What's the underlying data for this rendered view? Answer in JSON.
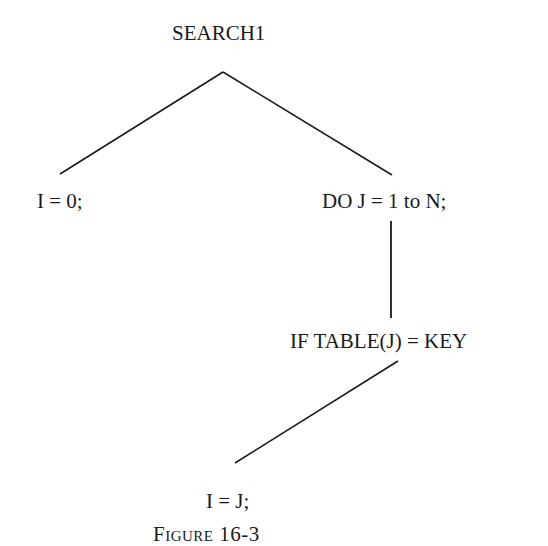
{
  "diagram": {
    "type": "tree",
    "nodes": [
      {
        "id": "root",
        "label": "SEARCH1"
      },
      {
        "id": "init",
        "label": "I = 0;"
      },
      {
        "id": "loop",
        "label": "DO J = 1 to N;"
      },
      {
        "id": "cond",
        "label": "IF TABLE(J) = KEY"
      },
      {
        "id": "assign",
        "label": "I = J;"
      }
    ],
    "edges": [
      {
        "from": "root",
        "to": "init"
      },
      {
        "from": "root",
        "to": "loop"
      },
      {
        "from": "loop",
        "to": "cond"
      },
      {
        "from": "cond",
        "to": "assign"
      }
    ],
    "caption": "Figure 16-3"
  },
  "colors": {
    "line": "#1a1a1a",
    "background": "#ffffff"
  }
}
